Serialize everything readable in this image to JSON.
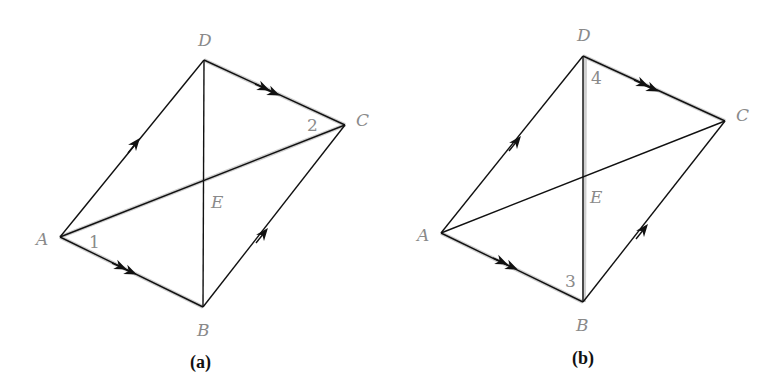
{
  "figures": [
    {
      "caption": "(a)",
      "vertices": {
        "A": "A",
        "B": "B",
        "C": "C",
        "D": "D",
        "E": "E"
      },
      "angle_labels": [
        "1",
        "2"
      ],
      "description": "Parallelogram ABCD with diagonals AC and BD meeting at E; AD ∥ BC (single arrows), AB ∥ DC (double arrows); angle 1 at A and angle 2 at C highlighted along diagonal AC"
    },
    {
      "caption": "(b)",
      "vertices": {
        "A": "A",
        "B": "B",
        "C": "C",
        "D": "D",
        "E": "E"
      },
      "angle_labels": [
        "3",
        "4"
      ],
      "description": "Same parallelogram ABCD; angle 3 at B and angle 4 at D highlighted along diagonal BD"
    }
  ],
  "colors": {
    "label": "#8a8a8a",
    "line": "#111111",
    "highlight": "#d0d0d0"
  }
}
